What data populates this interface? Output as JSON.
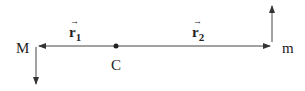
{
  "diagram": {
    "title": "",
    "nodes": [
      {
        "id": "M",
        "label": "M",
        "x": 36,
        "y": 46
      },
      {
        "id": "C",
        "label": "C",
        "x": 116,
        "y": 46
      },
      {
        "id": "m",
        "label": "m",
        "x": 272,
        "y": 46
      }
    ],
    "vectors": [
      {
        "id": "r1",
        "label": "r",
        "subscript": "1",
        "from": "C",
        "to": "M"
      },
      {
        "id": "r2",
        "label": "r",
        "subscript": "2",
        "from": "C",
        "to": "m"
      }
    ],
    "velocity_arrows": [
      {
        "at": "M",
        "direction": "down"
      },
      {
        "at": "m",
        "direction": "up"
      }
    ],
    "colors": {
      "stroke": "#333333",
      "text": "#222222"
    }
  }
}
